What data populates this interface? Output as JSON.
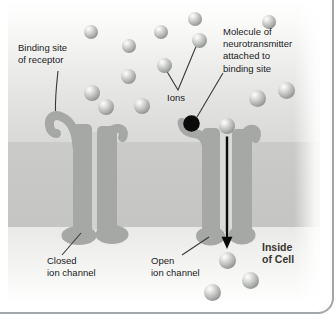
{
  "figure": {
    "labels": {
      "binding_site": "Binding site\nof receptor",
      "ions": "Ions",
      "neurotransmitter": "Molecule of\nneurotransmitter\nattached to\nbinding site",
      "closed_channel": "Closed\nion channel",
      "open_channel": "Open\nion channel",
      "inside_cell": "Inside\nof Cell"
    },
    "colors": {
      "channel": "#a5a8a5",
      "membrane": "#c8c8c6",
      "pore_closed": "#d2d2d0",
      "pore_open": "#dadad8",
      "leader_line": "#3a3a3a",
      "arrow": "#0a0a0a",
      "neurotransmitter_dot": "#0b0b0b",
      "border": "#a3a7a9",
      "label_text": "#1a1a1a",
      "inside_cell_text": "#3a362f"
    },
    "ions_extracellular": [
      {
        "x": 91,
        "y": 32,
        "r": 7
      },
      {
        "x": 129,
        "y": 46,
        "r": 7
      },
      {
        "x": 161,
        "y": 32,
        "r": 7
      },
      {
        "x": 195,
        "y": 19,
        "r": 7
      },
      {
        "x": 199,
        "y": 40,
        "r": 7.5
      },
      {
        "x": 269,
        "y": 22,
        "r": 7
      },
      {
        "x": 164,
        "y": 65,
        "r": 7.5
      },
      {
        "x": 128,
        "y": 76,
        "r": 7.5
      },
      {
        "x": 92,
        "y": 93,
        "r": 8
      },
      {
        "x": 106,
        "y": 107,
        "r": 8
      },
      {
        "x": 142,
        "y": 106,
        "r": 8
      },
      {
        "x": 257,
        "y": 98,
        "r": 8.5
      },
      {
        "x": 286,
        "y": 90,
        "r": 8.5
      },
      {
        "x": 227,
        "y": 126,
        "r": 8
      }
    ],
    "ions_intracellular": [
      {
        "x": 227,
        "y": 260,
        "r": 8.5
      },
      {
        "x": 250,
        "y": 280,
        "r": 8.5
      },
      {
        "x": 212,
        "y": 292,
        "r": 8.5
      }
    ]
  }
}
